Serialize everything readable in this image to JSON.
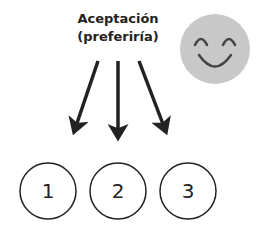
{
  "title": {
    "line1": "Aceptación",
    "line2": "(preferiría)"
  },
  "face": {
    "icon": "smiley-face-icon",
    "color": "#c8c8c8"
  },
  "options": [
    {
      "label": "1"
    },
    {
      "label": "2"
    },
    {
      "label": "3"
    }
  ]
}
